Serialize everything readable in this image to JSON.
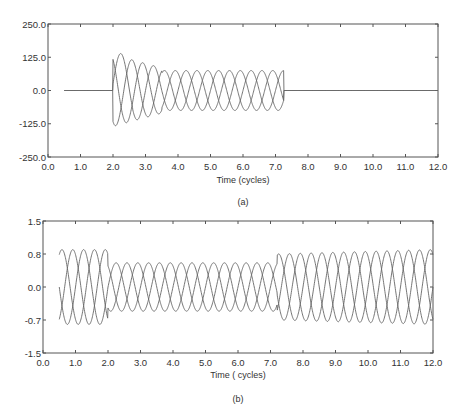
{
  "chart_data": [
    {
      "id": "a",
      "type": "line",
      "title": "",
      "caption": "(a)",
      "xlabel": "Time (cycles)",
      "ylabel": "",
      "xlim": [
        0.0,
        12.0
      ],
      "ylim": [
        -250.0,
        250.0
      ],
      "xticks": [
        "0.0",
        "1.0",
        "2.0",
        "3.0",
        "4.0",
        "5.0",
        "6.0",
        "7.0",
        "8.0",
        "9.0",
        "10.0",
        "11.0",
        "12.0"
      ],
      "yticks": [
        "250.0",
        "125.0",
        "0.0",
        "-125.0",
        "-250.0"
      ],
      "grid": false,
      "legend": null,
      "description": "Three-phase current waveform: zero from 0.5 to 2.0 cycles, fault transient with peaks ~135 and troughs ~-140 near 2.2-2.5 cycles, settling to ~±75 until ~7.3 cycles, then zero until 12.0",
      "series": [
        {
          "name": "phase-1",
          "phase_deg": 0
        },
        {
          "name": "phase-2",
          "phase_deg": 120
        },
        {
          "name": "phase-3",
          "phase_deg": 240
        }
      ],
      "segments": [
        {
          "t_start": 0.5,
          "t_end": 2.0,
          "amplitude": 0
        },
        {
          "t_start": 2.0,
          "t_end": 3.5,
          "amplitude_start": 135,
          "amplitude_end": 85
        },
        {
          "t_start": 3.5,
          "t_end": 7.25,
          "amplitude": 75
        },
        {
          "t_start": 7.25,
          "t_end": 12.0,
          "amplitude": 0
        }
      ]
    },
    {
      "id": "b",
      "type": "line",
      "title": "",
      "caption": "(b)",
      "xlabel": "Time ( cycles)",
      "ylabel": "",
      "xlim": [
        0.0,
        12.0
      ],
      "ylim": [
        -1.5,
        1.5
      ],
      "xticks": [
        "0.0",
        "1.0",
        "2.0",
        "3.0",
        "4.0",
        "5.0",
        "6.0",
        "7.0",
        "8.0",
        "9.0",
        "10.0",
        "11.0",
        "12.0"
      ],
      "yticks": [
        "1.5",
        "0.8",
        "0.0",
        "-0.7",
        "-1.5"
      ],
      "grid": false,
      "legend": null,
      "description": "Three-phase voltage waveform: amplitude ~0.85 from 0.5 to 2.0 cycles, sag to ~0.55 from 2.0 to 7.2 cycles, recovery to ~0.85 from ~7.3 to 12.0 cycles",
      "series": [
        {
          "name": "phase-1",
          "phase_deg": 0
        },
        {
          "name": "phase-2",
          "phase_deg": 120
        },
        {
          "name": "phase-3",
          "phase_deg": 240
        }
      ],
      "segments": [
        {
          "t_start": 0.5,
          "t_end": 2.0,
          "amplitude": 0.85
        },
        {
          "t_start": 2.0,
          "t_end": 7.2,
          "amplitude": 0.55
        },
        {
          "t_start": 7.2,
          "t_end": 12.0,
          "amplitude_start": 0.75,
          "amplitude_end": 0.85
        }
      ]
    }
  ],
  "layout": {
    "plots": [
      {
        "x0": 48,
        "y0": 24,
        "x1": 438,
        "y1": 157,
        "xtick_y": 170,
        "xlabel_y": 183,
        "caption_y": 205
      },
      {
        "x0": 43,
        "y0": 221,
        "x1": 433,
        "y1": 353,
        "xtick_y": 366,
        "xlabel_y": 378,
        "caption_y": 402
      }
    ]
  }
}
